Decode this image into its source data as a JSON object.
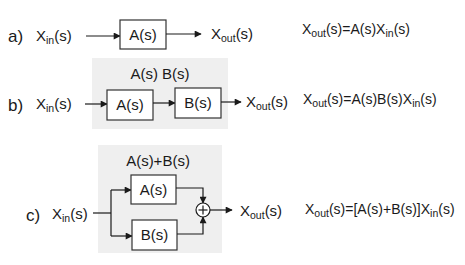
{
  "diagram": {
    "colors": {
      "panel": "#efefef",
      "line": "#1a1a1a",
      "box_fill": "#ffffff"
    },
    "rows": [
      {
        "id": "a",
        "label": "a)",
        "input": {
          "base": "X",
          "sub": "in",
          "arg": "(s)"
        },
        "blocks": [
          "A(s)"
        ],
        "output": {
          "base": "X",
          "sub": "out",
          "arg": "(s)"
        },
        "panel_caption": "",
        "equation": {
          "lhs_base": "X",
          "lhs_sub": "out",
          "lhs_arg": "(s)",
          "rhs": "=A(s)X",
          "rhs_sub": "in",
          "rhs_arg": "(s)"
        }
      },
      {
        "id": "b",
        "label": "b)",
        "input": {
          "base": "X",
          "sub": "in",
          "arg": "(s)"
        },
        "blocks": [
          "A(s)",
          "B(s)"
        ],
        "output": {
          "base": "X",
          "sub": "out",
          "arg": "(s)"
        },
        "panel_caption": "A(s) B(s)",
        "equation": {
          "lhs_base": "X",
          "lhs_sub": "out",
          "lhs_arg": "(s)",
          "rhs": "=A(s)B(s)X",
          "rhs_sub": "in",
          "rhs_arg": "(s)"
        }
      },
      {
        "id": "c",
        "label": "c)",
        "input": {
          "base": "X",
          "sub": "in",
          "arg": "(s)"
        },
        "blocks": [
          "A(s)",
          "B(s)"
        ],
        "summing_junction": "+",
        "output": {
          "base": "X",
          "sub": "out",
          "arg": "(s)"
        },
        "panel_caption": "A(s)+B(s)",
        "equation": {
          "lhs_base": "X",
          "lhs_sub": "out",
          "lhs_arg": "(s)",
          "rhs": "=[A(s)+B(s)]X",
          "rhs_sub": "in",
          "rhs_arg": "(s)"
        }
      }
    ]
  }
}
